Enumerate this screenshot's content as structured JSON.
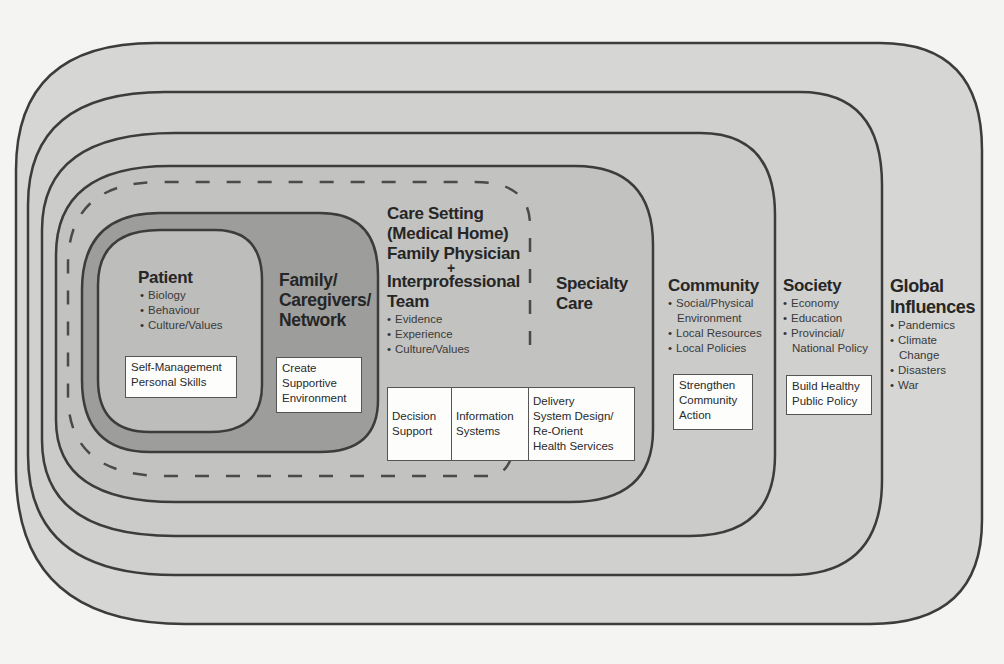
{
  "diagram": {
    "type": "nested-layers",
    "layers": [
      {
        "id": "patient",
        "title": "Patient",
        "bullets": [
          "Biology",
          "Behaviour",
          "Culture/Values"
        ],
        "action_box": [
          "Self-Management",
          "Personal Skills"
        ]
      },
      {
        "id": "family",
        "title_lines": [
          "Family/",
          "Caregivers/",
          "Network"
        ],
        "action_box": [
          "Create",
          "Supportive",
          "Environment"
        ]
      },
      {
        "id": "care-setting",
        "title_lines": [
          "Care Setting",
          "(Medical Home)",
          "Family Physician"
        ],
        "plus": "+",
        "title_lines_2": [
          "Interprofessional",
          "Team"
        ],
        "bullets": [
          "Evidence",
          "Experience",
          "Culture/Values"
        ],
        "action_boxes": [
          [
            "Decision",
            "Support"
          ],
          [
            "Information",
            "Systems"
          ],
          [
            "Delivery",
            "System Design/",
            "Re-Orient",
            "Health Services"
          ]
        ],
        "boundary_style": "dashed"
      },
      {
        "id": "specialty-care",
        "title_lines": [
          "Specialty",
          "Care"
        ]
      },
      {
        "id": "community",
        "title": "Community",
        "bullets": [
          "Social/Physical Environment",
          "Local Resources",
          "Local Policies"
        ],
        "action_box": [
          "Strengthen",
          "Community",
          "Action"
        ]
      },
      {
        "id": "society",
        "title": "Society",
        "bullets": [
          "Economy",
          "Education",
          "Provincial/ National Policy"
        ],
        "action_box": [
          "Build Healthy",
          "Public Policy"
        ]
      },
      {
        "id": "global",
        "title_lines": [
          "Global",
          "Influences"
        ],
        "bullets": [
          "Pandemics",
          "Climate Change",
          "Disasters",
          "War"
        ]
      }
    ],
    "colors": {
      "background": "#f4f4f2",
      "global": "#d6d6d4",
      "society": "#d0d0ce",
      "community": "#cbcbc9",
      "specialty": "#c2c2c0",
      "family": "#9d9d9b",
      "patient": "#bdbdbb",
      "stroke": "#3c3c3c",
      "box_fill": "#fdfdfc"
    }
  }
}
